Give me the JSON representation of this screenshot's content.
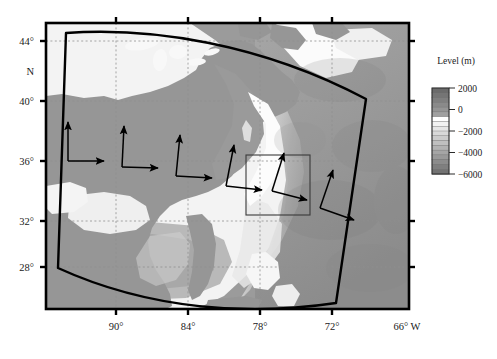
{
  "figure": {
    "type": "map"
  },
  "axes": {
    "x_axis": {
      "label_suffix": "W",
      "ticks": [
        {
          "value": 90,
          "label": "90°",
          "x": 116
        },
        {
          "value": 84,
          "label": "84°",
          "x": 188
        },
        {
          "value": 78,
          "label": "78°",
          "x": 260
        },
        {
          "value": 72,
          "label": "72°",
          "x": 332
        },
        {
          "value": 66,
          "label": "66° W",
          "x": 404
        }
      ]
    },
    "y_axis": {
      "hemisphere_label": "N",
      "ticks": [
        {
          "value": 44,
          "label": "44°",
          "y": 41
        },
        {
          "value": 40,
          "label": "40°",
          "y": 101
        },
        {
          "value": 36,
          "label": "36°",
          "y": 161
        },
        {
          "value": 32,
          "label": "32°",
          "y": 221
        },
        {
          "value": 28,
          "label": "28°",
          "y": 267
        }
      ]
    },
    "frame": {
      "left": 45,
      "top": 22,
      "right": 410,
      "bottom": 310
    }
  },
  "colorbar": {
    "title": "Level (m)",
    "ticks": [
      {
        "value": 2000,
        "label": "2000"
      },
      {
        "value": 0,
        "label": "0"
      },
      {
        "value": -2000,
        "label": "−2000"
      },
      {
        "value": -4000,
        "label": "−4000"
      },
      {
        "value": -6000,
        "label": "−6000"
      }
    ],
    "range": [
      -6000,
      2000
    ],
    "bands": [
      "#6b6b6b",
      "#757575",
      "#7f7f7f",
      "#8a8a8a",
      "#959595",
      "#a0a0a0",
      "#ffffff",
      "#f2f2f2",
      "#e6e6e6",
      "#d9d9d9",
      "#cccccc",
      "#bfbfbf",
      "#b2b2b2",
      "#a5a5a5",
      "#999999",
      "#8c8c8c",
      "#7f7f7f",
      "#737373"
    ]
  },
  "map_colors": {
    "land": "#969696",
    "shelf": "#fafafa",
    "shallow": "#ededed",
    "deep_ocean": "#9b9b9b",
    "deepest": "#8a8a8a",
    "outline": "#000000",
    "gridline": "#9a9a9a",
    "frame": "#000000"
  },
  "overlays": {
    "domain_outline_name": "model-domain-polygon",
    "inner_box_name": "nested-subdomain-box",
    "arrow_pairs_count": 6
  }
}
